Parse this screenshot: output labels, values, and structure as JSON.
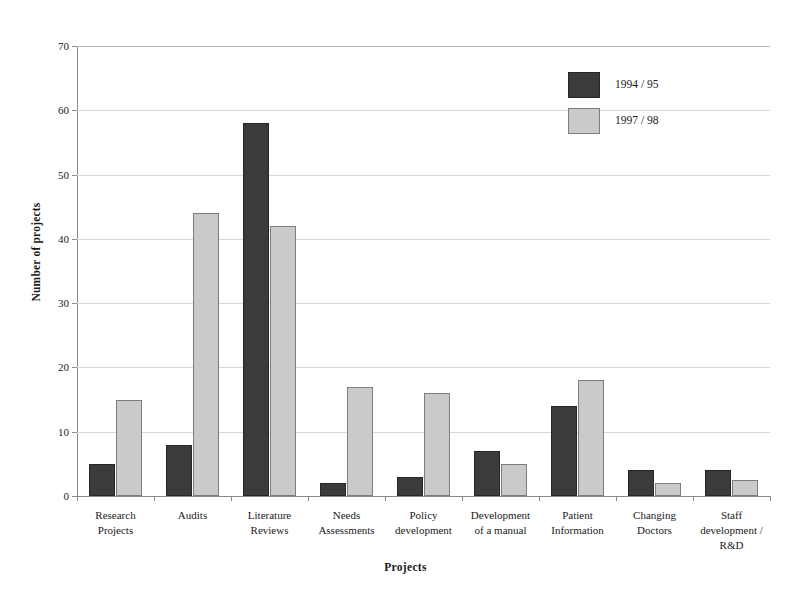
{
  "chart_data": {
    "type": "bar",
    "title": "",
    "xlabel": "Projects",
    "ylabel": "Number of projects",
    "ylim": [
      0,
      70
    ],
    "yticks": [
      0,
      10,
      20,
      30,
      40,
      50,
      60,
      70
    ],
    "ytick_labels": [
      "0",
      "10",
      "20",
      "30",
      "40",
      "50",
      "60",
      "70"
    ],
    "grid": true,
    "legend_position": "top-right",
    "categories": [
      "Research\nProjects",
      "Audits",
      "Literature\nReviews",
      "Needs\nAssessments",
      "Policy\ndevelopment",
      "Development\nof a manual",
      "Patient\nInformation",
      "Changing\nDoctors",
      "Staff\ndevelopment /\nR&D"
    ],
    "category_lines": [
      [
        "Research",
        "Projects"
      ],
      [
        "Audits"
      ],
      [
        "Literature",
        "Reviews"
      ],
      [
        "Needs",
        "Assessments"
      ],
      [
        "Policy",
        "development"
      ],
      [
        "Development",
        "of a manual"
      ],
      [
        "Patient",
        "Information"
      ],
      [
        "Changing",
        "Doctors"
      ],
      [
        "Staff",
        "development /",
        "R&D"
      ]
    ],
    "series": [
      {
        "name": "1994 / 95",
        "color": "#3b3b3b",
        "values": [
          5,
          8,
          58,
          2,
          3,
          7,
          14,
          4,
          4
        ]
      },
      {
        "name": "1997 / 98",
        "color": "#cacaca",
        "values": [
          15,
          44,
          42,
          17,
          16,
          5,
          18,
          2,
          2.5
        ]
      }
    ]
  },
  "legend": {
    "items": [
      {
        "label": "1994 / 95",
        "color": "#3b3b3b"
      },
      {
        "label": "1997 / 98",
        "color": "#cacaca"
      }
    ]
  },
  "axes": {
    "y_title": "Number of projects",
    "x_title": "Projects"
  },
  "colors": {
    "series_a": "#3b3b3b",
    "series_b": "#cacaca",
    "grid": "#d8d8d8",
    "axis": "#8a8a8a",
    "background": "#ffffff"
  }
}
